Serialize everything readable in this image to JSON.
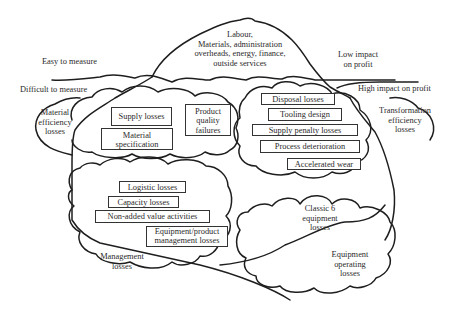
{
  "diagram": {
    "type": "iceberg-loss-model",
    "tip": {
      "lines": [
        "Labour,",
        "Materials, administration",
        "overheads, energy, finance,",
        "outside services"
      ]
    },
    "waterline_labels": {
      "easy": "Easy to measure",
      "difficult": "Difficult to measure",
      "low_impact": [
        "Low impact",
        "on profit"
      ],
      "high_impact": "High impact on profit"
    },
    "clouds": {
      "material_efficiency": {
        "label": [
          "Material",
          "efficiency",
          "losses"
        ]
      },
      "transformation_efficiency": {
        "label": [
          "Transformation",
          "efficiency",
          "losses"
        ]
      },
      "management": {
        "label": [
          "Management",
          "losses"
        ]
      },
      "classic_six": {
        "label": [
          "Classic 6",
          "equipment",
          "losses"
        ]
      },
      "equipment_operating": {
        "label": [
          "Equipment",
          "operating",
          "losses"
        ]
      }
    },
    "boxes": {
      "supply_losses": "Supply losses",
      "material_specification": [
        "Material",
        "specification"
      ],
      "product_quality_failures": [
        "Product",
        "quality",
        "failures"
      ],
      "disposal_losses": "Disposal losses",
      "tooling_design": "Tooling design",
      "supply_penalty_losses": "Supply penalty losses",
      "process_deterioration": "Process deterioration",
      "accelerated_wear": "Accelerated wear",
      "logistic_losses": "Logistic losses",
      "capacity_losses": "Capacity losses",
      "non_added_value": "Non-added value activities",
      "equipment_product_mgmt": [
        "Equipment/product",
        "management losses"
      ]
    }
  }
}
